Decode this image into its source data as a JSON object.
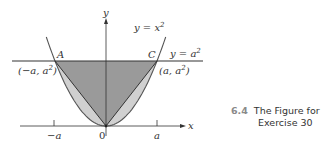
{
  "figure": {
    "curves": {
      "parabola_label": "y = x",
      "parabola_exp": "2",
      "line_label": "y = a",
      "line_exp": "2"
    },
    "points": {
      "A_label": "A",
      "C_label": "C",
      "A_coord": "(−a, a",
      "C_coord": "(a, a",
      "coord_exp": "2",
      "close_paren": ")"
    },
    "axes": {
      "x_label": "x",
      "y_label": "y",
      "origin_label": "0",
      "neg_a_label": "−a",
      "pos_a_label": "a"
    },
    "colors": {
      "triangle_fill": "#9a9a9a",
      "segment_fill": "#d0d0d0",
      "stroke": "#333333"
    }
  },
  "caption": {
    "number": "6.4",
    "line1": "The Figure for",
    "line2": "Exercise 30"
  }
}
